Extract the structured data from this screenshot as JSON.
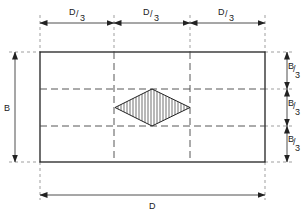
{
  "diagram": {
    "labels": {
      "top_thirds": [
        "D/3",
        "D/3",
        "D/3"
      ],
      "right_thirds": [
        "B/3",
        "B/3",
        "B/3"
      ],
      "left_dimension": "B",
      "bottom_dimension": "D"
    },
    "fraction_parts": {
      "D_num": "D",
      "B_num": "B",
      "den": "3"
    },
    "colors": {
      "line": "#222222",
      "dash": "#555555",
      "background": "#ffffff"
    }
  }
}
